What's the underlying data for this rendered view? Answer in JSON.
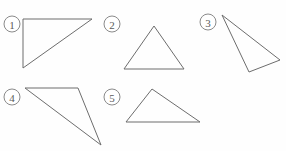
{
  "page": {
    "background_color": "#fefefe",
    "width": 286,
    "height": 151
  },
  "style": {
    "stroke_color": "#6d6d6d",
    "label_stroke_color": "#8a8a8a",
    "label_text_color": "#5a5a5a",
    "stroke_width": 1,
    "label_radius": 8
  },
  "figures": [
    {
      "id": "triangle-1",
      "label": "1",
      "label_x": 12,
      "label_y": 24,
      "points": "23,19 92,19 23,68",
      "kind": "right-triangle"
    },
    {
      "id": "triangle-2",
      "label": "2",
      "label_x": 112,
      "label_y": 24,
      "points": "154,26 184,69 124,69",
      "kind": "isosceles-triangle"
    },
    {
      "id": "triangle-3",
      "label": "3",
      "label_x": 208,
      "label_y": 22,
      "points": "222,15 280,60 249,72",
      "kind": "obtuse-triangle"
    },
    {
      "id": "triangle-4",
      "label": "4",
      "label_x": 12,
      "label_y": 97,
      "points": "25,88 78,88 101,145",
      "kind": "obtuse-triangle"
    },
    {
      "id": "triangle-5",
      "label": "5",
      "label_x": 112,
      "label_y": 97,
      "points": "152,89 200,122 126,122",
      "kind": "scalene-triangle"
    }
  ]
}
